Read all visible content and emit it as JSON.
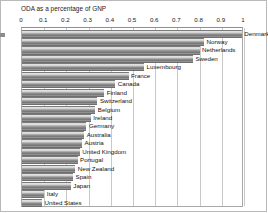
{
  "chart": {
    "title": "ODA as a percentage of GNP",
    "axis_tick_labels": [
      "0",
      "0.1",
      "0.2",
      "0.3",
      "0.4",
      "0.5",
      "0.6",
      "0.7",
      "0.8",
      "0.9",
      "1"
    ]
  },
  "chart_data": {
    "type": "bar",
    "orientation": "horizontal",
    "title": "ODA as a percentage of GNP",
    "xlabel": "",
    "ylabel": "",
    "xlim": [
      0,
      1
    ],
    "xticks": [
      0,
      0.1,
      0.2,
      0.3,
      0.4,
      0.5,
      0.6,
      0.7,
      0.8,
      0.9,
      1
    ],
    "grid": true,
    "legend": false,
    "bar_color": "#9a9a9a",
    "categories": [
      "Denmark",
      "Norway",
      "Netherlands",
      "Sweden",
      "Luxembourg",
      "France",
      "Canada",
      "Finland",
      "Switzerland",
      "Belgium",
      "Ireland",
      "Germany",
      "Australia",
      "Austria",
      "United Kingdom",
      "Portugal",
      "New Zealand",
      "Spain",
      "Japan",
      "Italy",
      "United States"
    ],
    "values": [
      0.99,
      0.82,
      0.8,
      0.77,
      0.55,
      0.48,
      0.42,
      0.37,
      0.34,
      0.33,
      0.31,
      0.29,
      0.28,
      0.27,
      0.26,
      0.25,
      0.24,
      0.23,
      0.22,
      0.1,
      0.09
    ]
  }
}
